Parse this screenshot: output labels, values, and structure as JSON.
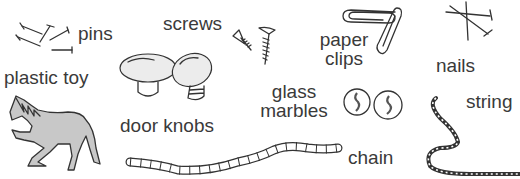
{
  "items": {
    "pins": {
      "label": "pins",
      "icon": "pins-icon"
    },
    "screws": {
      "label": "screws",
      "icon": "screws-icon"
    },
    "paper_clips": {
      "label_line1": "paper",
      "label_line2": "clips",
      "icon": "paper-clips-icon"
    },
    "nails": {
      "label": "nails",
      "icon": "nails-icon"
    },
    "plastic_toy": {
      "label": "plastic toy",
      "icon": "horse-icon"
    },
    "door_knobs": {
      "label": "door knobs",
      "icon": "door-knobs-icon"
    },
    "glass_marbles": {
      "label_line1": "glass",
      "label_line2": "marbles",
      "icon": "marbles-icon"
    },
    "string": {
      "label": "string",
      "icon": "string-icon"
    },
    "chain": {
      "label": "chain",
      "icon": "chain-icon"
    }
  },
  "colors": {
    "ink": "#333333",
    "horse_fill": "#c8c8c8",
    "background": "#ffffff"
  }
}
